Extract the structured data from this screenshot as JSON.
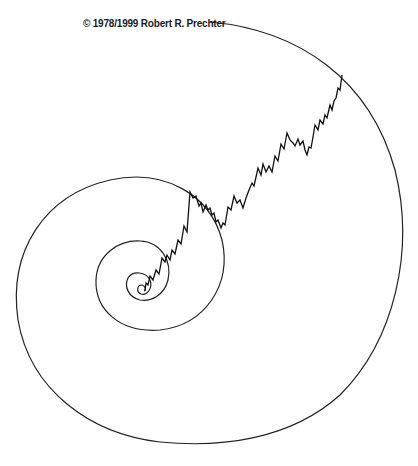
{
  "figure": {
    "copyright": "© 1978/1999 Robert R. Prechter",
    "colors": {
      "background": "#ffffff",
      "spiral": "#222222",
      "wave": "#111111"
    }
  }
}
